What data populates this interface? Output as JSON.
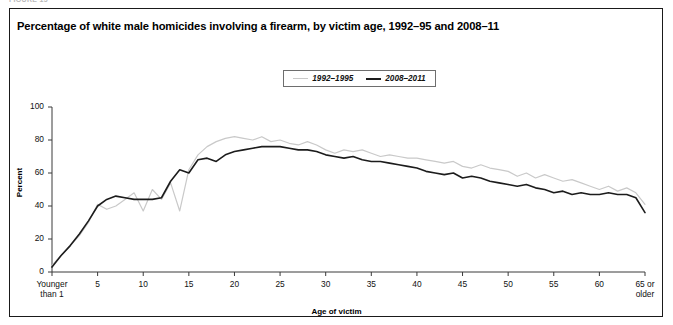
{
  "figure_caption": "FIGURE 15",
  "title": "Percentage of white male homicides involving a firearm, by victim age, 1992–95 and 2008–11",
  "legend": {
    "items": [
      {
        "label": "1992–1995",
        "color": "#c9c9c9",
        "style": "light"
      },
      {
        "label": "2008–2011",
        "color": "#1c1c1c",
        "style": "dark"
      }
    ]
  },
  "axes": {
    "y_title": "Percent",
    "x_title": "Age of victim",
    "y_ticks": [
      "0",
      "20",
      "40",
      "60",
      "80",
      "100"
    ],
    "x_ticks": [
      "Younger than 1",
      "5",
      "10",
      "15",
      "20",
      "25",
      "30",
      "35",
      "40",
      "45",
      "50",
      "55",
      "60",
      "65 or older"
    ]
  },
  "chart_data": {
    "type": "line",
    "title": "Percentage of white male homicides involving a firearm, by victim age, 1992–95 and 2008–11",
    "xlabel": "Age of victim",
    "ylabel": "Percent",
    "xlim": [
      0,
      65
    ],
    "ylim": [
      0,
      100
    ],
    "grid": false,
    "legend_position": "top-center",
    "x": [
      0,
      1,
      2,
      3,
      4,
      5,
      6,
      7,
      8,
      9,
      10,
      11,
      12,
      13,
      14,
      15,
      16,
      17,
      18,
      19,
      20,
      21,
      22,
      23,
      24,
      25,
      26,
      27,
      28,
      29,
      30,
      31,
      32,
      33,
      34,
      35,
      36,
      37,
      38,
      39,
      40,
      41,
      42,
      43,
      44,
      45,
      46,
      47,
      48,
      49,
      50,
      51,
      52,
      53,
      54,
      55,
      56,
      57,
      58,
      59,
      60,
      61,
      62,
      63,
      64,
      65
    ],
    "x_tick_values": [
      0,
      5,
      10,
      15,
      20,
      25,
      30,
      35,
      40,
      45,
      50,
      55,
      60,
      65
    ],
    "x_tick_labels": [
      "Younger than 1",
      "5",
      "10",
      "15",
      "20",
      "25",
      "30",
      "35",
      "40",
      "45",
      "50",
      "55",
      "60",
      "65 or older"
    ],
    "y_ticks": [
      0,
      20,
      40,
      60,
      80,
      100
    ],
    "series": [
      {
        "name": "1992–1995",
        "color": "#c9c9c9",
        "width": 1.2,
        "values": [
          4,
          10,
          16,
          22,
          30,
          41,
          38,
          40,
          44,
          48,
          37,
          50,
          44,
          54,
          37,
          62,
          71,
          76,
          79,
          81,
          82,
          81,
          80,
          82,
          79,
          80,
          78,
          77,
          79,
          77,
          74,
          72,
          74,
          73,
          74,
          72,
          70,
          71,
          70,
          69,
          69,
          68,
          67,
          66,
          67,
          64,
          63,
          65,
          63,
          62,
          61,
          58,
          60,
          57,
          59,
          57,
          55,
          56,
          54,
          52,
          50,
          52,
          49,
          51,
          48,
          41
        ]
      },
      {
        "name": "2008–2011",
        "color": "#1c1c1c",
        "width": 1.6,
        "values": [
          3,
          10,
          16,
          23,
          31,
          40,
          44,
          46,
          45,
          44,
          44,
          44,
          45,
          55,
          62,
          60,
          68,
          69,
          67,
          71,
          73,
          74,
          75,
          76,
          76,
          76,
          75,
          74,
          74,
          73,
          71,
          70,
          69,
          70,
          68,
          67,
          67,
          66,
          65,
          64,
          63,
          61,
          60,
          59,
          60,
          57,
          58,
          57,
          55,
          54,
          53,
          52,
          53,
          51,
          50,
          48,
          49,
          47,
          48,
          47,
          47,
          48,
          47,
          47,
          45,
          36
        ]
      }
    ]
  }
}
